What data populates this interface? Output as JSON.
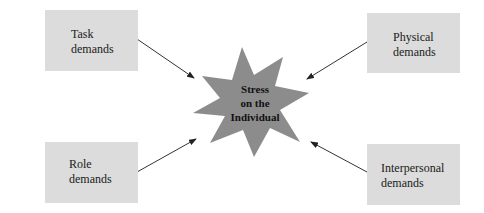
{
  "diagram": {
    "center": {
      "label": "Stress\non the\nIndividual",
      "shape": "star",
      "fill": "#8c8c8c"
    },
    "sources": [
      {
        "id": "task",
        "label": "Task\ndemands",
        "position": "top-left"
      },
      {
        "id": "physical",
        "label": "Physical\ndemands",
        "position": "top-right"
      },
      {
        "id": "role",
        "label": "Role\ndemands",
        "position": "bottom-left"
      },
      {
        "id": "interpersonal",
        "label": "Interpersonal\ndemands",
        "position": "bottom-right"
      }
    ],
    "edges": [
      {
        "from": "task",
        "to": "center"
      },
      {
        "from": "physical",
        "to": "center"
      },
      {
        "from": "role",
        "to": "center"
      },
      {
        "from": "interpersonal",
        "to": "center"
      }
    ],
    "colors": {
      "box_fill": "#dcdcdc",
      "star_fill": "#8c8c8c",
      "arrow": "#333333",
      "text": "#1a1a1a"
    }
  }
}
